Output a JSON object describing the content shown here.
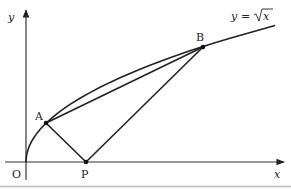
{
  "diagram": {
    "type": "geometry-graph",
    "curve": {
      "equation_label": "y = √x",
      "lhs": "y",
      "eq": "=",
      "rhs_var": "x"
    },
    "axes": {
      "x_label": "x",
      "y_label": "y",
      "origin_label": "O"
    },
    "points": {
      "A": {
        "label": "A"
      },
      "B": {
        "label": "B"
      },
      "P": {
        "label": "P"
      }
    },
    "segments": [
      "AB",
      "AP",
      "BP"
    ],
    "colors": {
      "stroke": "#222222",
      "background": "#ffffff",
      "border": "#bbbbbb"
    }
  }
}
